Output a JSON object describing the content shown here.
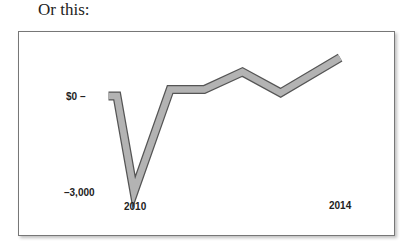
{
  "caption": "Or this:",
  "chart_data": {
    "type": "line",
    "title": "",
    "xlabel": "",
    "ylabel": "",
    "x": [
      2009.4,
      2009.6,
      2010,
      2010.85,
      2011.65,
      2012.55,
      2013.45,
      2014.85
    ],
    "series": [
      {
        "name": "value",
        "values": [
          0,
          0,
          -3000,
          200,
          200,
          750,
          100,
          1200
        ]
      }
    ],
    "y_tick_labels": [
      "$0",
      "-3,000"
    ],
    "x_tick_labels": [
      "2010",
      "2014"
    ],
    "ylim": [
      -3000,
      1200
    ],
    "grid": false,
    "legend": "none",
    "line_style": "thick gray ribbon with dark outline"
  },
  "labels": {
    "y_zero": "$0 –",
    "y_min": "–3,000",
    "x_start": "2010",
    "x_end": "2014"
  },
  "colors": {
    "line_fill": "#b3b3b3",
    "line_outline": "#555555",
    "frame": "#777777"
  }
}
